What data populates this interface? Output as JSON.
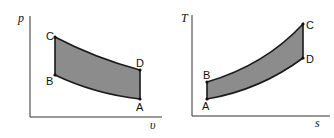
{
  "diagrams": [
    {
      "name": "p-v diagram",
      "y_axis_label": "p",
      "x_axis_label": "υ",
      "points": {
        "A": "A",
        "B": "B",
        "C": "C",
        "D": "D"
      },
      "fill_color": "#8c8c8c",
      "line_color": "#1a1a1a"
    },
    {
      "name": "T-s diagram",
      "y_axis_label": "T",
      "x_axis_label": "s",
      "points": {
        "A": "A",
        "B": "B",
        "C": "C",
        "D": "D"
      },
      "fill_color": "#8c8c8c",
      "line_color": "#1a1a1a"
    }
  ]
}
